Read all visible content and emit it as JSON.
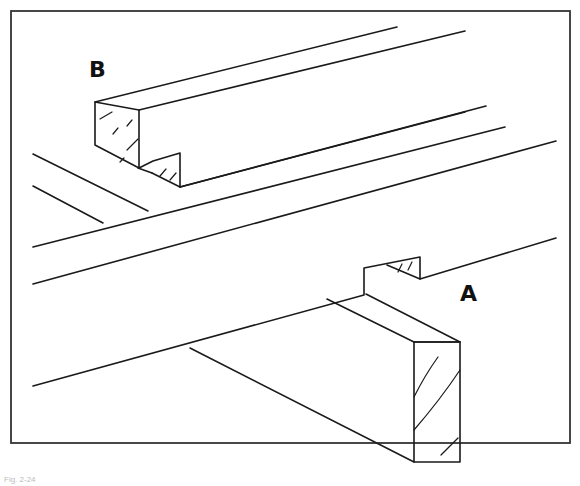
{
  "figure": {
    "labels": {
      "a": "A",
      "b": "B"
    },
    "caption": "Fig. 2-24"
  },
  "colors": {
    "line": "#1a1a1a",
    "background": "#ffffff",
    "frame": "#333333"
  }
}
